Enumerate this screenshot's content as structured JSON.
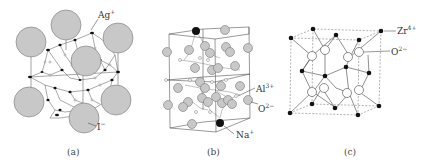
{
  "figure": {
    "panels": [
      {
        "id": "a",
        "caption": "(a)",
        "labels": [
          {
            "text": "Ag",
            "charge": "+"
          },
          {
            "text": "I",
            "charge": "−"
          }
        ]
      },
      {
        "id": "b",
        "caption": "(b)",
        "labels": [
          {
            "text": "Al",
            "charge": "3+"
          },
          {
            "text": "O",
            "charge": "2−"
          },
          {
            "text": "Na",
            "charge": "+"
          }
        ]
      },
      {
        "id": "c",
        "caption": "(c)",
        "labels": [
          {
            "text": "Zr",
            "charge": "4+"
          },
          {
            "text": "O",
            "charge": "2−"
          }
        ]
      }
    ],
    "colors": {
      "large_ion": "#c8c8c8",
      "small_ion": "#111111",
      "open_ion": "#ffffff",
      "line": "#555555"
    }
  }
}
